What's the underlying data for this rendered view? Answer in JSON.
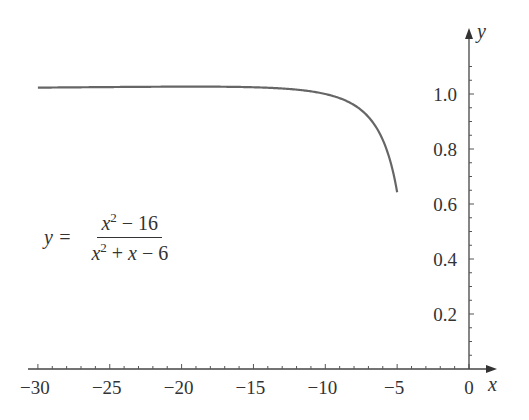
{
  "chart_data": {
    "type": "line",
    "title": "",
    "xlabel": "x",
    "ylabel": "y",
    "xlim": [
      -30.5,
      1.5
    ],
    "ylim": [
      0,
      1.15
    ],
    "grid": false,
    "legend": null,
    "x_ticks": [
      -30,
      -25,
      -20,
      -15,
      -10,
      -5,
      0
    ],
    "x_tick_labels": [
      "−30",
      "−25",
      "−20",
      "−15",
      "−10",
      "−5",
      "0"
    ],
    "y_ticks": [
      0.2,
      0.4,
      0.6,
      0.8,
      1.0
    ],
    "y_tick_labels": [
      "0.2",
      "0.4",
      "0.6",
      "0.8",
      "1.0"
    ],
    "annotation": {
      "lhs": "y =",
      "numerator": "x² − 16",
      "denominator": "x² + x − 6"
    },
    "series": [
      {
        "name": "y = (x^2 - 16)/(x^2 + x - 6)",
        "x": [
          -30,
          -27,
          -25,
          -22,
          -20,
          -18,
          -15,
          -13,
          -12,
          -11,
          -10,
          -9,
          -8,
          -7,
          -6.5,
          -6,
          -5.5,
          -5.25,
          -5
        ],
        "y": [
          1.0231,
          1.0245,
          1.0253,
          1.0264,
          1.0267,
          1.0264,
          1.0245,
          1.0213,
          1.0159,
          1.0096,
          1.0,
          0.9848,
          0.96,
          0.9167,
          0.8843,
          0.8333,
          0.76,
          0.7105,
          0.6429
        ]
      }
    ]
  },
  "axes": {
    "x_name": "x",
    "y_name": "y"
  }
}
